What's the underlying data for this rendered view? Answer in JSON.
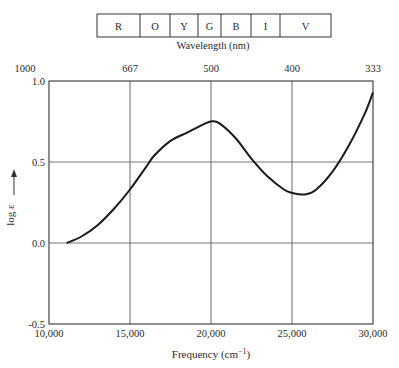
{
  "spectrum_bar": {
    "bands": [
      "R",
      "O",
      "Y",
      "G",
      "B",
      "I",
      "V"
    ],
    "label": "Wavelength (nm)"
  },
  "chart_data": {
    "type": "line",
    "title": "",
    "xlabel": "Frequency (cm⁻¹)",
    "ylabel": "log ε",
    "xlim": [
      10000,
      30000
    ],
    "ylim": [
      -0.5,
      1.0
    ],
    "x_ticks": [
      10000,
      15000,
      20000,
      25000,
      30000
    ],
    "x_tick_labels": [
      "10,000",
      "15,000",
      "20,000",
      "25,000",
      "30,000"
    ],
    "y_ticks": [
      -0.5,
      0.0,
      0.5,
      1.0
    ],
    "y_tick_labels": [
      "-0.5",
      "0.0",
      "0.5",
      "1.0"
    ],
    "secondary_x_axis": {
      "label": "Wavelength (nm)",
      "position": "top",
      "tick_positions_cm1": [
        10000,
        15000,
        20000,
        25000,
        30000
      ],
      "tick_labels": [
        "1000",
        "667",
        "500",
        "400",
        "333"
      ]
    },
    "grid": true,
    "series": [
      {
        "name": "absorption",
        "x": [
          11100,
          12000,
          13000,
          14000,
          15000,
          16000,
          16500,
          17500,
          18500,
          19500,
          20000,
          20500,
          21500,
          22500,
          23500,
          24500,
          25000,
          25800,
          26500,
          27500,
          28500,
          29500,
          30000
        ],
        "y": [
          0.0,
          0.04,
          0.11,
          0.21,
          0.33,
          0.47,
          0.54,
          0.63,
          0.68,
          0.73,
          0.75,
          0.74,
          0.65,
          0.52,
          0.41,
          0.33,
          0.31,
          0.3,
          0.33,
          0.44,
          0.6,
          0.8,
          0.93
        ]
      }
    ]
  }
}
